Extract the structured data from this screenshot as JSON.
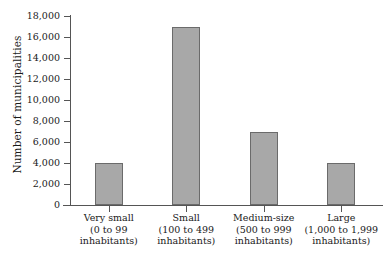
{
  "chart_data": {
    "type": "bar",
    "title": "",
    "subtitle": "",
    "xlabel": "",
    "ylabel": "Number of municipalities",
    "categories": [
      "Very small",
      "Small",
      "Medium-size",
      "Large"
    ],
    "category_sublabels": [
      [
        "(0 to 99",
        "inhabitants)"
      ],
      [
        "(100 to 499",
        "inhabitants)"
      ],
      [
        "(500 to 999",
        "inhabitants)"
      ],
      [
        "(1,000 to 1,999",
        "inhabitants)"
      ]
    ],
    "values": [
      4000,
      17000,
      7000,
      4000
    ],
    "ylim": [
      0,
      18000
    ],
    "ytick_values": [
      0,
      2000,
      4000,
      6000,
      8000,
      10000,
      12000,
      14000,
      16000,
      18000
    ],
    "ytick_labels": [
      "0",
      "2,000",
      "4,000",
      "6,000",
      "8,000",
      "10,000",
      "12,000",
      "14,000",
      "16,000",
      "18,000"
    ],
    "grid": false,
    "legend": false,
    "legend_position": "none",
    "bar_fill_color": "#a8a8a8",
    "bar_border_color": "#6b6b6b",
    "axis_color": "#555555",
    "background_color": "#ffffff"
  }
}
